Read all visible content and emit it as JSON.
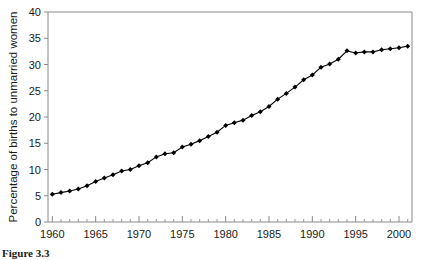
{
  "figure": {
    "caption_partial": "Figure 3.3",
    "colors": {
      "line": "#000000",
      "marker": "#000000",
      "axis": "#888888",
      "background": "#ffffff"
    }
  },
  "chart_data": {
    "type": "line",
    "title": "",
    "subtitle": "",
    "xlabel": "",
    "ylabel": "Percentage of births to unmarried women",
    "xlim": [
      1959.5,
      2001.5
    ],
    "ylim": [
      0,
      40
    ],
    "grid": false,
    "legend": null,
    "marker": "diamond",
    "y_ticks": [
      0,
      5,
      10,
      15,
      20,
      25,
      30,
      35,
      40
    ],
    "y_tick_labels": [
      "0",
      "5",
      "10",
      "15",
      "20",
      "25",
      "30",
      "35",
      "40"
    ],
    "x_ticks": [
      1960,
      1965,
      1970,
      1975,
      1980,
      1985,
      1990,
      1995,
      2000
    ],
    "x_tick_labels": [
      "1960",
      "1965",
      "1970",
      "1975",
      "1980",
      "1985",
      "1990",
      "1995",
      "2000"
    ],
    "x_minor_tick_step": 1,
    "x": [
      1960,
      1961,
      1962,
      1963,
      1964,
      1965,
      1966,
      1967,
      1968,
      1969,
      1970,
      1971,
      1972,
      1973,
      1974,
      1975,
      1976,
      1977,
      1978,
      1979,
      1980,
      1981,
      1982,
      1983,
      1984,
      1985,
      1986,
      1987,
      1988,
      1989,
      1990,
      1991,
      1992,
      1993,
      1994,
      1995,
      1996,
      1997,
      1998,
      1999,
      2000,
      2001
    ],
    "values": [
      5.3,
      5.6,
      5.9,
      6.3,
      6.9,
      7.7,
      8.4,
      9.0,
      9.7,
      10.0,
      10.7,
      11.3,
      12.4,
      13.0,
      13.2,
      14.3,
      14.8,
      15.5,
      16.3,
      17.1,
      18.4,
      18.9,
      19.4,
      20.3,
      21.0,
      22.0,
      23.4,
      24.5,
      25.7,
      27.1,
      28.0,
      29.5,
      30.1,
      31.0,
      32.6,
      32.2,
      32.4,
      32.4,
      32.8,
      33.0,
      33.2,
      33.5
    ],
    "series": [
      {
        "name": "Percentage of births to unmarried women",
        "values": [
          5.3,
          5.6,
          5.9,
          6.3,
          6.9,
          7.7,
          8.4,
          9.0,
          9.7,
          10.0,
          10.7,
          11.3,
          12.4,
          13.0,
          13.2,
          14.3,
          14.8,
          15.5,
          16.3,
          17.1,
          18.4,
          18.9,
          19.4,
          20.3,
          21.0,
          22.0,
          23.4,
          24.5,
          25.7,
          27.1,
          28.0,
          29.5,
          30.1,
          31.0,
          32.6,
          32.2,
          32.4,
          32.4,
          32.8,
          33.0,
          33.2,
          33.5
        ]
      }
    ]
  }
}
